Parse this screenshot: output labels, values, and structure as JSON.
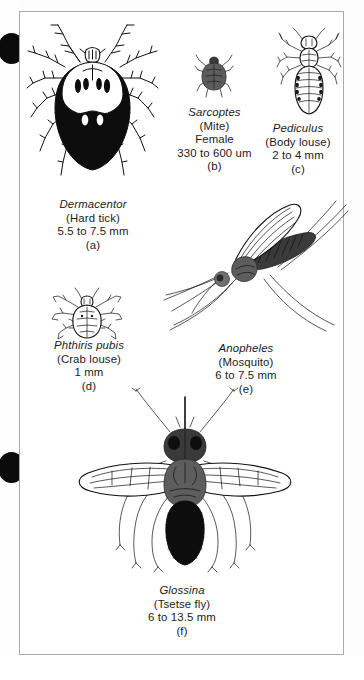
{
  "figure": {
    "panel_count": 6,
    "border_color": "#a9a9ac",
    "ink_color": "#111111"
  },
  "margin_marks": {
    "binder_hole_top": "binder-hole",
    "binder_hole_bottom": "binder-hole"
  },
  "panels": [
    {
      "letter": "(a)",
      "genus": "Dermacentor",
      "common": "(Hard tick)",
      "size": "5.5 to 7.5 mm",
      "icon": "hard-tick-illustration"
    },
    {
      "letter": "(b)",
      "genus": "Sarcoptes",
      "common": "(Mite)",
      "sex": "Female",
      "size": "330 to 600 um",
      "icon": "mite-illustration"
    },
    {
      "letter": "(c)",
      "genus": "Pediculus",
      "common": "(Body louse)",
      "size": "2 to 4 mm",
      "icon": "body-louse-illustration"
    },
    {
      "letter": "(d)",
      "genus": "Phthiris pubis",
      "common": "(Crab louse)",
      "size": "1 mm",
      "icon": "crab-louse-illustration"
    },
    {
      "letter": "(e)",
      "genus": "Anopheles",
      "common": "(Mosquito)",
      "size": "6 to 7.5 mm",
      "icon": "mosquito-illustration"
    },
    {
      "letter": "(f)",
      "genus": "Glossina",
      "common": "(Tsetse fly)",
      "size": "6 to 13.5 mm",
      "icon": "tsetse-fly-illustration"
    }
  ]
}
